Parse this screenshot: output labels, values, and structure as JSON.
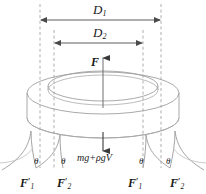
{
  "figure": {
    "background_color": "#ffffff",
    "line_color": "#8a8a8a",
    "text_color": "#1a1a1a",
    "dimension_color": "#555555"
  },
  "dimensions": {
    "outer": {
      "symbol": "D",
      "subscript": "1",
      "name": "outer-diameter"
    },
    "inner": {
      "symbol": "D",
      "subscript": "2",
      "name": "inner-diameter"
    }
  },
  "forces": {
    "buoyancy": {
      "symbol": "F",
      "direction": "up",
      "name": "buoyancy-force"
    },
    "weight": {
      "expression": "mg+ρgV",
      "direction": "down",
      "name": "weight-buoyancy-force"
    },
    "mooring": [
      {
        "symbol": "F",
        "subscript": "1",
        "prime": "′",
        "side": "left-outer"
      },
      {
        "symbol": "F",
        "subscript": "2",
        "prime": "′",
        "side": "left-inner"
      },
      {
        "symbol": "F",
        "subscript": "1",
        "prime": "′",
        "side": "right-inner"
      },
      {
        "symbol": "F",
        "subscript": "2",
        "prime": "′",
        "side": "right-outer"
      }
    ]
  },
  "angles": {
    "symbol": "θ",
    "count": 4,
    "labels": [
      "θ",
      "θ",
      "θ",
      "θ"
    ]
  }
}
